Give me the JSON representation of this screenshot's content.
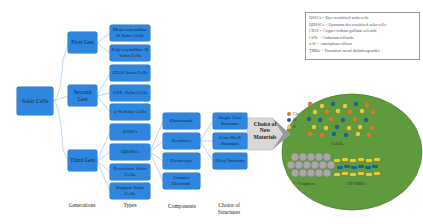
{
  "root": {
    "label": "Solar Cells"
  },
  "generations": [
    {
      "label": "First Gen"
    },
    {
      "label": "Second Gen"
    },
    {
      "label": "Third Gen"
    }
  ],
  "types": [
    {
      "label": "Mono-crystalline Si Solar Cells",
      "gen": 0
    },
    {
      "label": "Poly-crystalline Si Solar Cells",
      "gen": 0
    },
    {
      "label": "CIGS Solar Cells",
      "gen": 1
    },
    {
      "label": "CdTe Solar Cells",
      "gen": 1
    },
    {
      "label": "a-Si Solar Cells",
      "gen": 1
    },
    {
      "label": "DSSCs",
      "gen": 2
    },
    {
      "label": "QDSSCs",
      "gen": 2
    },
    {
      "label": "Perovskite Solar Cells",
      "gen": 2
    },
    {
      "label": "Organic Solar Cells",
      "gen": 2
    }
  ],
  "components": [
    {
      "label": "Photoanode"
    },
    {
      "label": "Sensitizer"
    },
    {
      "label": "Electrolyte"
    },
    {
      "label": "Counter Electrode"
    }
  ],
  "structures": [
    {
      "label": "Single Core Structure"
    },
    {
      "label": "Core/Shell Structure"
    },
    {
      "label": "Alloy Structure"
    }
  ],
  "arrow": {
    "label": "Choice of New Materials"
  },
  "materials": {
    "cuins2_label": "CuInS₂",
    "graphene_label": "Graphene",
    "tmds_label": "2D TMDs",
    "atom_legend": [
      {
        "symbol": "Cu",
        "color": "#e0762a"
      },
      {
        "symbol": "In",
        "color": "#1f5fa0"
      },
      {
        "symbol": "S",
        "color": "#f2c53d"
      }
    ],
    "ellipse_color": "#5f9a3c"
  },
  "column_labels": {
    "generations": "Generations",
    "types": "Types",
    "components": "Components",
    "structures": "Choice of Structures"
  },
  "legend": {
    "lines": [
      "DSSCs = Dye-sensitized solar cells",
      "QDSSCs = Quantum dot sensitized solar cells",
      "CIGS = Copper indium gallium selenide",
      "CdTe = Cadmium telluride",
      "a-Si = Amorphous silicon",
      "TMDs = Transition metal dichalcogenides"
    ]
  },
  "colors": {
    "box_fill": "#2e86de",
    "connector": "#8fb8e8"
  }
}
